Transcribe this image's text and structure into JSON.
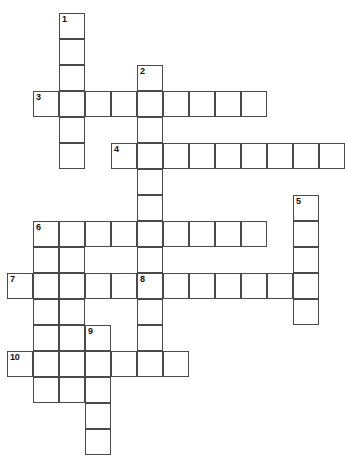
{
  "puzzle": {
    "type": "crossword-grid",
    "title": "Crossword Puzzle Grid",
    "grid": {
      "cell_size": 26,
      "origin_x": 7,
      "origin_y": 13,
      "columns": 12,
      "rows": 17,
      "border_color": "#4a4a4a",
      "cell_fill": "#ffffff",
      "background": "#ffffff",
      "number_color": "#111111"
    },
    "entries": [
      {
        "number": "1",
        "direction": "down",
        "row": 0,
        "col": 2,
        "length": 6
      },
      {
        "number": "2",
        "direction": "down",
        "row": 2,
        "col": 5,
        "length": 7
      },
      {
        "number": "3",
        "direction": "across",
        "row": 3,
        "col": 1,
        "length": 9
      },
      {
        "number": "4",
        "direction": "across",
        "row": 5,
        "col": 4,
        "length": 9
      },
      {
        "number": "5",
        "direction": "down",
        "row": 7,
        "col": 11,
        "length": 5
      },
      {
        "number": "6",
        "direction": "across",
        "row": 8,
        "col": 1,
        "length": 9
      },
      {
        "number": "6",
        "direction": "down",
        "row": 8,
        "col": 1,
        "length": 7
      },
      {
        "number": "7",
        "direction": "across",
        "row": 10,
        "col": 0,
        "length": 5
      },
      {
        "number": "8",
        "direction": "across",
        "row": 10,
        "col": 5,
        "length": 7
      },
      {
        "number": "8",
        "direction": "down",
        "row": 10,
        "col": 5,
        "length": 4
      },
      {
        "number": "9",
        "direction": "down",
        "row": 12,
        "col": 3,
        "length": 5
      },
      {
        "number": "10",
        "direction": "across",
        "row": 13,
        "col": 0,
        "length": 7
      }
    ],
    "cells": [
      {
        "row": 0,
        "col": 2,
        "number": "1"
      },
      {
        "row": 1,
        "col": 2,
        "number": ""
      },
      {
        "row": 2,
        "col": 2,
        "number": ""
      },
      {
        "row": 2,
        "col": 5,
        "number": "2"
      },
      {
        "row": 3,
        "col": 1,
        "number": "3"
      },
      {
        "row": 3,
        "col": 2,
        "number": ""
      },
      {
        "row": 3,
        "col": 3,
        "number": ""
      },
      {
        "row": 3,
        "col": 4,
        "number": ""
      },
      {
        "row": 3,
        "col": 5,
        "number": ""
      },
      {
        "row": 3,
        "col": 6,
        "number": ""
      },
      {
        "row": 3,
        "col": 7,
        "number": ""
      },
      {
        "row": 3,
        "col": 8,
        "number": ""
      },
      {
        "row": 3,
        "col": 9,
        "number": ""
      },
      {
        "row": 4,
        "col": 2,
        "number": ""
      },
      {
        "row": 4,
        "col": 5,
        "number": ""
      },
      {
        "row": 5,
        "col": 2,
        "number": ""
      },
      {
        "row": 5,
        "col": 4,
        "number": "4"
      },
      {
        "row": 5,
        "col": 5,
        "number": ""
      },
      {
        "row": 5,
        "col": 6,
        "number": ""
      },
      {
        "row": 5,
        "col": 7,
        "number": ""
      },
      {
        "row": 5,
        "col": 8,
        "number": ""
      },
      {
        "row": 5,
        "col": 9,
        "number": ""
      },
      {
        "row": 5,
        "col": 10,
        "number": ""
      },
      {
        "row": 5,
        "col": 11,
        "number": ""
      },
      {
        "row": 5,
        "col": 12,
        "number": ""
      },
      {
        "row": 6,
        "col": 5,
        "number": ""
      },
      {
        "row": 7,
        "col": 5,
        "number": ""
      },
      {
        "row": 7,
        "col": 11,
        "number": "5"
      },
      {
        "row": 8,
        "col": 1,
        "number": "6"
      },
      {
        "row": 8,
        "col": 2,
        "number": ""
      },
      {
        "row": 8,
        "col": 3,
        "number": ""
      },
      {
        "row": 8,
        "col": 4,
        "number": ""
      },
      {
        "row": 8,
        "col": 5,
        "number": ""
      },
      {
        "row": 8,
        "col": 6,
        "number": ""
      },
      {
        "row": 8,
        "col": 7,
        "number": ""
      },
      {
        "row": 8,
        "col": 8,
        "number": ""
      },
      {
        "row": 8,
        "col": 9,
        "number": ""
      },
      {
        "row": 8,
        "col": 11,
        "number": ""
      },
      {
        "row": 9,
        "col": 1,
        "number": ""
      },
      {
        "row": 9,
        "col": 2,
        "number": ""
      },
      {
        "row": 9,
        "col": 5,
        "number": ""
      },
      {
        "row": 9,
        "col": 11,
        "number": ""
      },
      {
        "row": 10,
        "col": 0,
        "number": "7"
      },
      {
        "row": 10,
        "col": 1,
        "number": ""
      },
      {
        "row": 10,
        "col": 2,
        "number": ""
      },
      {
        "row": 10,
        "col": 3,
        "number": ""
      },
      {
        "row": 10,
        "col": 4,
        "number": ""
      },
      {
        "row": 10,
        "col": 5,
        "number": "8"
      },
      {
        "row": 10,
        "col": 6,
        "number": ""
      },
      {
        "row": 10,
        "col": 7,
        "number": ""
      },
      {
        "row": 10,
        "col": 8,
        "number": ""
      },
      {
        "row": 10,
        "col": 9,
        "number": ""
      },
      {
        "row": 10,
        "col": 10,
        "number": ""
      },
      {
        "row": 10,
        "col": 11,
        "number": ""
      },
      {
        "row": 11,
        "col": 1,
        "number": ""
      },
      {
        "row": 11,
        "col": 2,
        "number": ""
      },
      {
        "row": 11,
        "col": 5,
        "number": ""
      },
      {
        "row": 11,
        "col": 11,
        "number": ""
      },
      {
        "row": 12,
        "col": 1,
        "number": ""
      },
      {
        "row": 12,
        "col": 2,
        "number": ""
      },
      {
        "row": 12,
        "col": 3,
        "number": "9"
      },
      {
        "row": 12,
        "col": 5,
        "number": ""
      },
      {
        "row": 13,
        "col": 0,
        "number": "10"
      },
      {
        "row": 13,
        "col": 1,
        "number": ""
      },
      {
        "row": 13,
        "col": 2,
        "number": ""
      },
      {
        "row": 13,
        "col": 3,
        "number": ""
      },
      {
        "row": 13,
        "col": 4,
        "number": ""
      },
      {
        "row": 13,
        "col": 5,
        "number": ""
      },
      {
        "row": 13,
        "col": 6,
        "number": ""
      },
      {
        "row": 14,
        "col": 1,
        "number": ""
      },
      {
        "row": 14,
        "col": 2,
        "number": ""
      },
      {
        "row": 14,
        "col": 3,
        "number": ""
      },
      {
        "row": 15,
        "col": 3,
        "number": ""
      },
      {
        "row": 16,
        "col": 3,
        "number": ""
      }
    ]
  }
}
